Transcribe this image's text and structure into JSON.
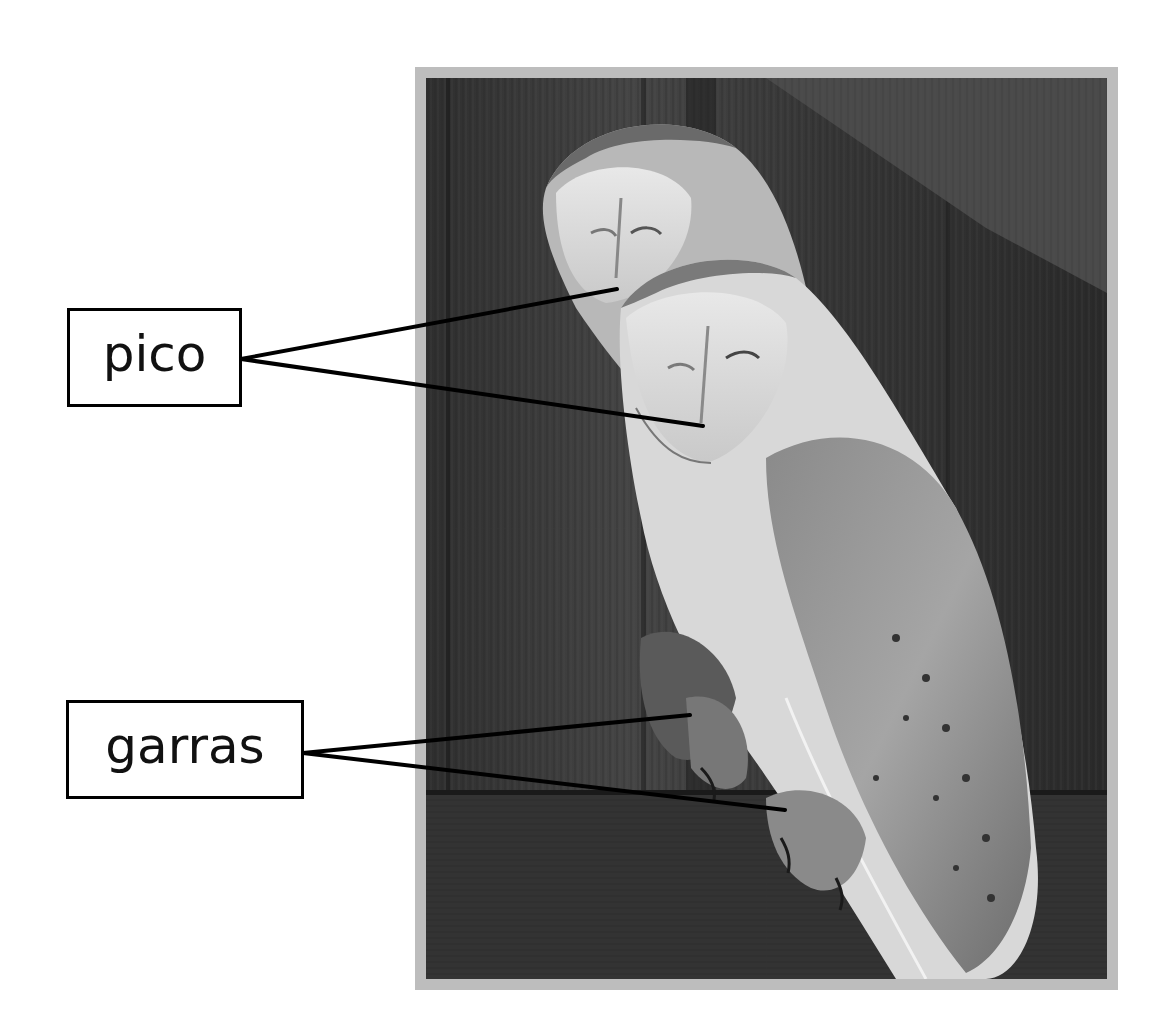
{
  "diagram": {
    "photo_style": "grayscale photograph",
    "labels": [
      {
        "id": "pico",
        "text": "pico",
        "targets": [
          "beak of rear owl",
          "beak of front owl"
        ]
      },
      {
        "id": "garras",
        "text": "garras",
        "targets": [
          "talons of left foot",
          "talons of right foot"
        ]
      }
    ]
  },
  "colors": {
    "frame": "#bdbdbd",
    "leader_line": "#000000",
    "label_border": "#000000",
    "background": "#ffffff"
  }
}
